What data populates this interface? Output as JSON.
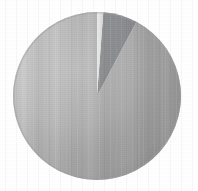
{
  "figure": {
    "background_color": "#ffffff",
    "width": 198,
    "height": 191
  },
  "geometry": {
    "center_x": 97,
    "center_y": 96,
    "radius": 84
  },
  "chart_data": {
    "type": "pie",
    "title": "",
    "subtitle": "",
    "xlabel": "",
    "ylabel": "",
    "legend_position": "none",
    "grid": false,
    "start_angle_deg": 0,
    "direction": "clockwise",
    "labels": [
      "Slice 1",
      "Slice 2",
      "Slice 3"
    ],
    "values": [
      1.2,
      6.6,
      92.2
    ],
    "percentages": [
      "1.2%",
      "6.6%",
      "92.2%"
    ],
    "colors": [
      "#e2e2e2",
      "#7f8184",
      "#a8a8a8"
    ],
    "slices": [
      {
        "name": "Slice 1",
        "value": 1.2,
        "percent": "1.2%",
        "color": "#e2e2e2",
        "start_deg": 0,
        "end_deg": 4.3
      },
      {
        "name": "Slice 2",
        "value": 6.6,
        "percent": "6.6%",
        "color": "#7f8184",
        "start_deg": 4.3,
        "end_deg": 28.0
      },
      {
        "name": "Slice 3",
        "value": 92.2,
        "percent": "92.2%",
        "color": "#a8a8a8",
        "start_deg": 28.0,
        "end_deg": 360
      }
    ]
  },
  "shading": {
    "main_highlight_color": "#c4c4c4",
    "main_base_color": "#a6a6a6",
    "main_shadow_color": "#9a9a9a",
    "dark_highlight_color": "#8c8e91",
    "dark_base_color": "#787a7d",
    "sliver_highlight_color": "#ececec",
    "sliver_base_color": "#dcdcdc",
    "edge_shadow_color": "#9d9d9d"
  }
}
